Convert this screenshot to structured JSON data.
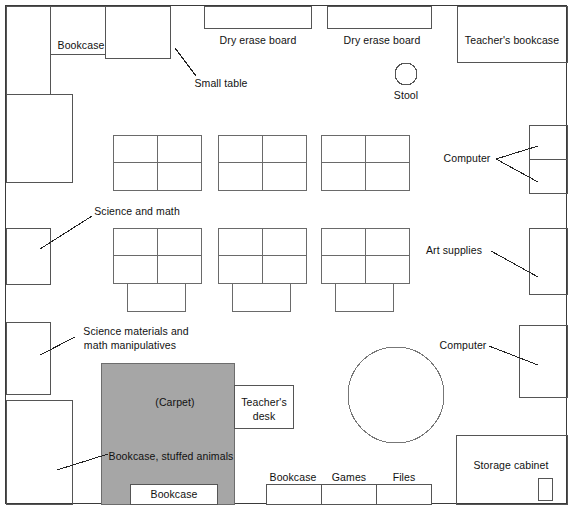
{
  "diagram": {
    "type": "floor-plan",
    "canvas": {
      "width": 572,
      "height": 509
    },
    "colors": {
      "wall": "#3a3a3a",
      "furniture_stroke": "#555555",
      "carpet_fill": "#a6a6a6",
      "carpet_stroke": "#6d6d6d",
      "background": "#ffffff",
      "text": "#111111",
      "leader_line": "#222222"
    }
  },
  "labels": {
    "bookcase_top_left": "Bookcase",
    "small_table": "Small table",
    "dry_erase_board_1": "Dry erase board",
    "dry_erase_board_2": "Dry erase board",
    "teachers_bookcase": "Teacher's bookcase",
    "stool": "Stool",
    "computer_top_right": "Computer",
    "science_and_math": "Science and math",
    "art_supplies": "Art supplies",
    "science_materials_line1": "Science materials and",
    "science_materials_line2": "math manipulatives",
    "computer_lower_right": "Computer",
    "carpet": "(Carpet)",
    "teachers_desk_line1": "Teacher's",
    "teachers_desk_line2": "desk",
    "bookcase_stuffed_animals": "Bookcase, stuffed animals",
    "bookcase_carpet_bottom": "Bookcase",
    "bookcase_bottom": "Bookcase",
    "games": "Games",
    "files": "Files",
    "storage_cabinet": "Storage cabinet"
  },
  "furniture": {
    "walls": {
      "x": 5,
      "y": 5,
      "width": 562,
      "height": 499
    },
    "left_wall_units": [
      {
        "name": "bookcase-left-upper",
        "x": 6,
        "y": 6,
        "height": 88,
        "width": 44
      },
      {
        "name": "shelf-left-2",
        "x": 6,
        "y": 94,
        "height": 88,
        "width": 66
      },
      {
        "name": "shelf-left-3",
        "x": 6,
        "y": 228,
        "height": 56,
        "width": 44
      },
      {
        "name": "shelf-left-4",
        "x": 6,
        "y": 322,
        "height": 72,
        "width": 44
      },
      {
        "name": "shelf-left-5",
        "x": 6,
        "y": 400,
        "height": 104,
        "width": 66
      }
    ],
    "top_wall_units": [
      {
        "name": "bookcase-top-label-area",
        "x": 50,
        "y": 6,
        "height": 48,
        "width": 55
      },
      {
        "name": "small-table",
        "x": 105,
        "y": 6,
        "width": 65,
        "height": 52
      },
      {
        "name": "dry-erase-board-1",
        "x": 204,
        "y": 6,
        "width": 107,
        "height": 22
      },
      {
        "name": "dry-erase-board-2",
        "x": 327,
        "y": 6,
        "width": 104,
        "height": 22
      },
      {
        "name": "teachers-bookcase",
        "x": 457,
        "y": 6,
        "width": 110,
        "height": 56
      }
    ],
    "right_wall_units": [
      {
        "name": "computer-top-1",
        "x": 529,
        "y": 125,
        "width": 38,
        "height": 34
      },
      {
        "name": "computer-top-2",
        "x": 529,
        "y": 159,
        "width": 38,
        "height": 34
      },
      {
        "name": "art-supplies",
        "x": 529,
        "y": 228,
        "width": 38,
        "height": 66
      },
      {
        "name": "computer-lower",
        "x": 519,
        "y": 325,
        "width": 48,
        "height": 72
      },
      {
        "name": "storage-cabinet",
        "x": 456,
        "y": 435,
        "width": 111,
        "height": 69
      },
      {
        "name": "storage-cabinet-inner",
        "x": 538,
        "y": 478,
        "width": 14,
        "height": 22
      }
    ],
    "desk_clusters": [
      {
        "name": "desk-cluster-1",
        "x": 113,
        "y": 135,
        "width": 88,
        "height": 55
      },
      {
        "name": "desk-cluster-2",
        "x": 218,
        "y": 135,
        "width": 88,
        "height": 55
      },
      {
        "name": "desk-cluster-3",
        "x": 321,
        "y": 135,
        "width": 88,
        "height": 55
      },
      {
        "name": "desk-cluster-4",
        "x": 113,
        "y": 228,
        "width": 88,
        "height": 55,
        "attached": {
          "x": 127,
          "y": 283,
          "width": 58,
          "height": 28
        }
      },
      {
        "name": "desk-cluster-5",
        "x": 218,
        "y": 228,
        "width": 88,
        "height": 55,
        "attached": {
          "x": 232,
          "y": 283,
          "width": 58,
          "height": 28
        }
      },
      {
        "name": "desk-cluster-6",
        "x": 321,
        "y": 228,
        "width": 88,
        "height": 55,
        "attached": {
          "x": 335,
          "y": 283,
          "width": 58,
          "height": 28
        }
      }
    ],
    "stool": {
      "name": "stool",
      "cx": 406,
      "cy": 74,
      "r": 11
    },
    "round_table": {
      "name": "round-table",
      "cx": 396,
      "cy": 395,
      "r": 48
    },
    "carpet": {
      "name": "carpet",
      "x": 101,
      "y": 363,
      "width": 133,
      "height": 141
    },
    "teachers_desk": {
      "name": "teachers-desk",
      "x": 234,
      "y": 385,
      "width": 59,
      "height": 43
    },
    "bookcase_on_carpet": {
      "name": "bookcase-carpet",
      "x": 130,
      "y": 484,
      "width": 87,
      "height": 20
    },
    "bottom_units": [
      {
        "name": "bookcase-bottom",
        "x": 266,
        "y": 484,
        "width": 55,
        "height": 20
      },
      {
        "name": "games-bottom",
        "x": 321,
        "y": 484,
        "width": 55,
        "height": 20
      },
      {
        "name": "files-bottom",
        "x": 376,
        "y": 484,
        "width": 55,
        "height": 20
      }
    ]
  }
}
